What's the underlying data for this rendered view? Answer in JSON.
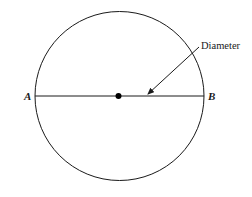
{
  "diagram": {
    "type": "geometry-circle",
    "points": {
      "left": "A",
      "right": "B"
    },
    "annotation": "Diameter",
    "center_marker": "center-dot",
    "colors": {
      "stroke": "#1a1a1a",
      "background": "#ffffff"
    }
  }
}
